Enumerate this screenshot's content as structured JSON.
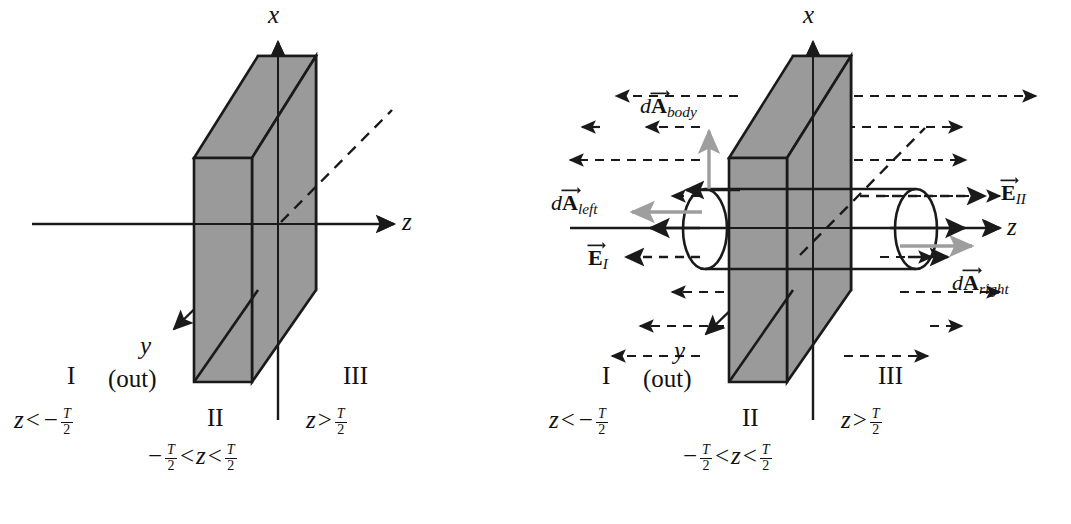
{
  "figure": {
    "type": "physics-diagram",
    "colors": {
      "slab_fill": "#9a9a9a",
      "outline": "#1a1a1a",
      "gray_vector": "#9e9e9e",
      "background": "#ffffff"
    }
  },
  "panels": [
    {
      "id": "left",
      "name": "slab-geometry-panel",
      "axes": {
        "x": "x",
        "y": "y",
        "z": "z",
        "y_note": "(out)"
      },
      "regions": [
        {
          "numeral": "I",
          "condition_plain": "z < -T/2",
          "z_symbol": "z",
          "op": "<",
          "sign": "−",
          "num": "T",
          "den": "2"
        },
        {
          "numeral": "II",
          "condition_plain": "-T/2 < z < T/2"
        },
        {
          "numeral": "III",
          "condition_plain": "z > T/2",
          "z_symbol": "z",
          "op": ">",
          "sign": "",
          "num": "T",
          "den": "2"
        }
      ],
      "region_II_detail": {
        "sign": "−",
        "num1": "T",
        "den1": "2",
        "op1": "<",
        "z_symbol": "z",
        "op2": "<",
        "num2": "T",
        "den2": "2"
      }
    },
    {
      "id": "right",
      "name": "gauss-cylinder-panel",
      "axes": {
        "x": "x",
        "y": "y",
        "z": "z",
        "y_note": "(out)"
      },
      "vectors": [
        {
          "name": "dA-body-label",
          "lead": "d",
          "bold": "A",
          "sub": "body",
          "color": "#9e9e9e",
          "direction": "up"
        },
        {
          "name": "dA-left-label",
          "lead": "d",
          "bold": "A",
          "sub": "left",
          "color": "#9e9e9e",
          "direction": "left"
        },
        {
          "name": "dA-right-label",
          "lead": "d",
          "bold": "A",
          "sub": "right",
          "color": "#9e9e9e",
          "direction": "right"
        },
        {
          "name": "E-I-label",
          "lead": "",
          "bold": "E",
          "sub": "I",
          "color": "#1a1a1a",
          "direction": "left"
        },
        {
          "name": "E-II-label",
          "lead": "",
          "bold": "E",
          "sub": "II",
          "color": "#1a1a1a",
          "direction": "right"
        }
      ],
      "regions": [
        {
          "numeral": "I",
          "condition_plain": "z < -T/2",
          "z_symbol": "z",
          "op": "<",
          "sign": "−",
          "num": "T",
          "den": "2"
        },
        {
          "numeral": "II",
          "condition_plain": "-T/2 < z < T/2"
        },
        {
          "numeral": "III",
          "condition_plain": "z > T/2",
          "z_symbol": "z",
          "op": ">",
          "sign": "",
          "num": "T",
          "den": "2"
        }
      ],
      "region_II_detail": {
        "sign": "−",
        "num1": "T",
        "den1": "2",
        "op1": "<",
        "z_symbol": "z",
        "op2": "<",
        "num2": "T",
        "den2": "2"
      },
      "field_lines": {
        "count_pairs": 8,
        "style": "dashed",
        "left_direction": "left",
        "right_direction": "right"
      }
    }
  ]
}
